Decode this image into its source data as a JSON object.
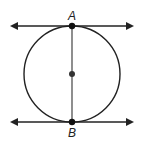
{
  "diagram": {
    "points": [
      {
        "id": "A",
        "label": "A",
        "role": "endpoint of diameter, point of tangency (top)"
      },
      {
        "id": "B",
        "label": "B",
        "role": "endpoint of diameter, point of tangency (bottom)"
      },
      {
        "id": "center",
        "label": "",
        "role": "center of circle"
      }
    ],
    "lines": [
      {
        "id": "tangent-top",
        "through": "A",
        "type": "line with arrows both ends"
      },
      {
        "id": "tangent-bottom",
        "through": "B",
        "type": "line with arrows both ends"
      },
      {
        "id": "diameter",
        "from": "A",
        "to": "B",
        "type": "segment"
      }
    ],
    "colors": {
      "stroke": "#222222",
      "background": "#ffffff"
    }
  }
}
